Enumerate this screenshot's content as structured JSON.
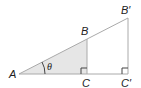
{
  "diagram": {
    "type": "similar-right-triangles",
    "labels": {
      "A": "A",
      "B": "B",
      "C": "C",
      "B_prime": "B′",
      "C_prime": "C′",
      "angle": "θ"
    },
    "colors": {
      "line": "#aaaaaa",
      "fill": "#e6e6e6",
      "text": "#222222"
    }
  }
}
